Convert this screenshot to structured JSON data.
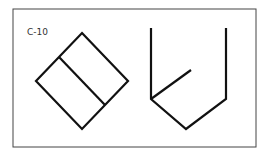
{
  "figure": {
    "label": "C-10",
    "colors": {
      "stroke": "#111111",
      "frame": "#444444",
      "background": "#ffffff"
    },
    "shapes": [
      {
        "name": "rotated-square-with-divider",
        "description": "Square rotated 45 degrees with a diagonal line dividing it into two rectangles"
      },
      {
        "name": "open-pentagon-shape",
        "description": "Open container shape with two vertical sides, V-shaped bottom and an inner diagonal stroke"
      }
    ]
  }
}
